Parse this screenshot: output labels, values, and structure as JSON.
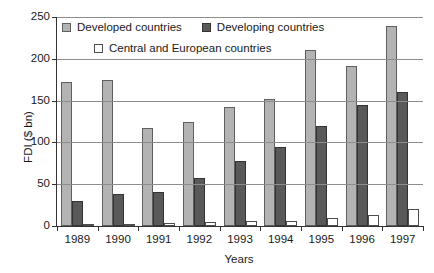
{
  "chart_data": {
    "type": "bar",
    "title": "",
    "xlabel": "Years",
    "ylabel": "FDI ($ bn)",
    "categories": [
      "1989",
      "1990",
      "1991",
      "1992",
      "1993",
      "1994",
      "1995",
      "1996",
      "1997"
    ],
    "series": [
      {
        "name": "Developed countries",
        "color": "#b3b3b3",
        "values": [
          172,
          175,
          117,
          125,
          142,
          152,
          210,
          192,
          239
        ]
      },
      {
        "name": "Developing countries",
        "color": "#595959",
        "values": [
          30,
          38,
          41,
          58,
          78,
          95,
          120,
          145,
          160
        ]
      },
      {
        "name": "Central and European countries",
        "color": "#ffffff",
        "values": [
          2,
          2,
          4,
          5,
          6,
          6,
          9,
          13,
          20
        ]
      }
    ],
    "ylim": [
      0,
      250
    ],
    "yticks": [
      0,
      50,
      100,
      150,
      200,
      250
    ],
    "ytick_labels": [
      "0",
      "50",
      "100",
      "150",
      "200",
      "250"
    ],
    "grid": true,
    "legend_position": "top-left-inside"
  }
}
